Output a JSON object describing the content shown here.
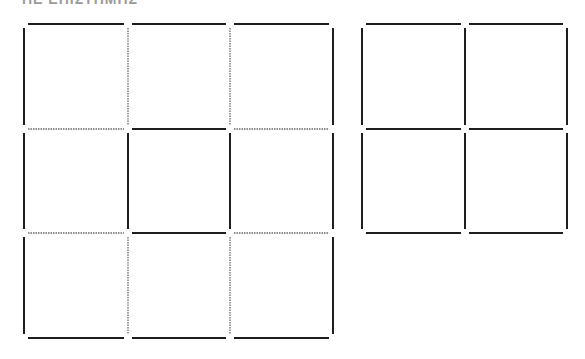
{
  "title": "ΠΕ ΕΠΙΣΤΗΜΗΣ",
  "colors": {
    "line": "#1e1e1e",
    "dotted": "#6a6a6a",
    "background": "#ffffff"
  },
  "grids": [
    {
      "name": "left-grid-3x3",
      "xs": [
        24,
        128,
        230,
        333
      ],
      "ys": [
        24,
        129,
        233,
        338
      ],
      "h_edges": [
        [
          "solid",
          "solid",
          "solid"
        ],
        [
          "dotted",
          "solid",
          "dotted"
        ],
        [
          "dotted",
          "solid",
          "dotted"
        ],
        [
          "solid",
          "solid",
          "solid"
        ]
      ],
      "v_edges": [
        [
          "solid",
          "dotted",
          "dotted",
          "solid"
        ],
        [
          "solid",
          "solid",
          "solid",
          "solid"
        ],
        [
          "solid",
          "dotted",
          "dotted",
          "solid"
        ]
      ]
    },
    {
      "name": "right-grid-2x2",
      "xs": [
        362,
        465,
        567
      ],
      "ys": [
        24,
        129,
        233
      ],
      "h_edges": [
        [
          "solid",
          "solid"
        ],
        [
          "solid",
          "solid"
        ],
        [
          "solid",
          "solid"
        ]
      ],
      "v_edges": [
        [
          "solid",
          "solid",
          "solid"
        ],
        [
          "solid",
          "solid",
          "solid"
        ]
      ]
    }
  ]
}
